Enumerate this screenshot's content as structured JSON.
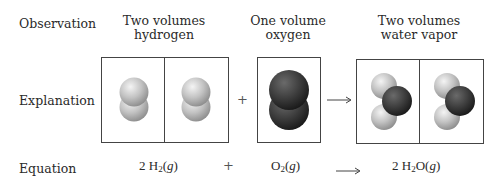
{
  "row_labels": {
    "observation": "Observation",
    "explanation": "Explanation",
    "equation": "Equation"
  },
  "columns": [
    {
      "line1": "Two volumes",
      "line2": "hydrogen"
    },
    {
      "line1": "One volume",
      "line2": "oxygen"
    },
    {
      "line1": "Two volumes",
      "line2": "water vapor"
    }
  ],
  "operators": {
    "plus": "+",
    "arrow": "⟶"
  },
  "equation": {
    "term1": {
      "coef": "2 H",
      "sub": "2",
      "state": "(g)"
    },
    "term2": {
      "coef": "O",
      "sub": "2",
      "state": "(g)"
    },
    "term3": {
      "coef": "2 H",
      "sub": "2",
      "rest": "O",
      "state": "(g)"
    }
  },
  "molecules": {
    "hydrogen": {
      "count": 2,
      "color": "#bcbcbc",
      "formula": "H2"
    },
    "oxygen": {
      "count": 1,
      "color": "#3c3c3c",
      "formula": "O2"
    },
    "water": {
      "count": 2,
      "colors": {
        "h": "#c4c4c4",
        "o": "#363636"
      },
      "formula": "H2O"
    }
  }
}
